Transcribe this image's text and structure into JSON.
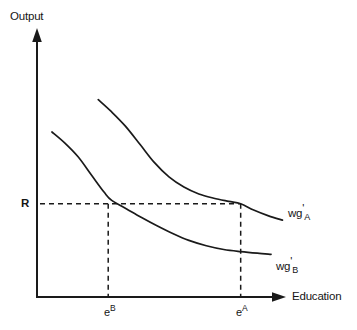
{
  "chart_data": {
    "type": "line",
    "title": "",
    "xlabel": "Education",
    "ylabel": "Output",
    "grid": false,
    "legend_position": "inline-right-of-curves",
    "axis_style": "arrow-tipped open axes",
    "xlim": [
      0,
      1
    ],
    "ylim": [
      0,
      1
    ],
    "x_ticks": [
      {
        "label_base": "e",
        "label_sup": "B",
        "value": 0.286
      },
      {
        "label_base": "e",
        "label_sup": "A",
        "value": 0.818
      }
    ],
    "y_ticks": [
      {
        "label": "R",
        "value": 0.349
      }
    ],
    "annotations": [
      {
        "name": "reservation-utility-line",
        "type": "horizontal-dashed",
        "y": 0.349,
        "x_from": 0.012,
        "x_to": 0.818
      },
      {
        "name": "eB-drop-line",
        "type": "vertical-dashed",
        "x": 0.286,
        "y_from": 0.0,
        "y_to": 0.349
      },
      {
        "name": "eA-drop-line",
        "type": "vertical-dashed",
        "x": 0.818,
        "y_from": 0.0,
        "y_to": 0.349
      }
    ],
    "series": [
      {
        "name": "wg'_A",
        "label_base": "wg",
        "label_prime": "'",
        "label_sub": "A",
        "description": "upper downward-sloping marginal product curve for type A workers",
        "points": [
          [
            0.246,
            0.739
          ],
          [
            0.3,
            0.693
          ],
          [
            0.355,
            0.64
          ],
          [
            0.415,
            0.57
          ],
          [
            0.47,
            0.505
          ],
          [
            0.53,
            0.45
          ],
          [
            0.59,
            0.412
          ],
          [
            0.65,
            0.386
          ],
          [
            0.71,
            0.37
          ],
          [
            0.77,
            0.358
          ],
          [
            0.818,
            0.349
          ],
          [
            0.87,
            0.326
          ],
          [
            0.93,
            0.304
          ],
          [
            0.986,
            0.288
          ]
        ]
      },
      {
        "name": "wg'_B",
        "label_base": "wg",
        "label_prime": "'",
        "label_sub": "B",
        "description": "lower downward-sloping marginal product curve for type B workers",
        "points": [
          [
            0.06,
            0.618
          ],
          [
            0.11,
            0.578
          ],
          [
            0.165,
            0.525
          ],
          [
            0.22,
            0.455
          ],
          [
            0.27,
            0.392
          ],
          [
            0.3,
            0.362
          ],
          [
            0.36,
            0.33
          ],
          [
            0.42,
            0.298
          ],
          [
            0.48,
            0.268
          ],
          [
            0.545,
            0.238
          ],
          [
            0.61,
            0.212
          ],
          [
            0.68,
            0.192
          ],
          [
            0.75,
            0.178
          ],
          [
            0.818,
            0.17
          ],
          [
            0.885,
            0.164
          ],
          [
            0.94,
            0.16
          ]
        ]
      }
    ]
  },
  "labels": {
    "y_axis": "Output",
    "x_axis": "Education",
    "reservation": "R",
    "tick_eB_base": "e",
    "tick_eB_sup": "B",
    "tick_eA_base": "e",
    "tick_eA_sup": "A",
    "curve_a_base": "wg",
    "curve_a_prime": "'",
    "curve_a_sub": "A",
    "curve_b_base": "wg",
    "curve_b_prime": "'",
    "curve_b_sub": "B"
  },
  "colors": {
    "ink": "#1a1a1a",
    "background": "#ffffff"
  }
}
